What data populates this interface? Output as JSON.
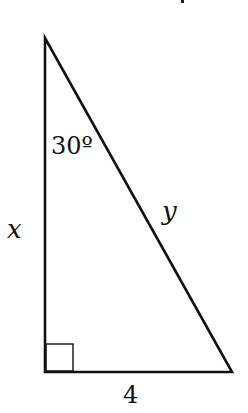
{
  "diagram": {
    "type": "right-triangle",
    "vertices": {
      "apex": {
        "x": 45,
        "y": 38
      },
      "right_angle_corner": {
        "x": 45,
        "y": 372
      },
      "base_right": {
        "x": 232,
        "y": 372
      }
    },
    "right_angle_marker_size": 27,
    "stroke_color": "#111111",
    "labels": {
      "angle": "30º",
      "vertical_side": "x",
      "hypotenuse": "y",
      "base": "4"
    }
  }
}
